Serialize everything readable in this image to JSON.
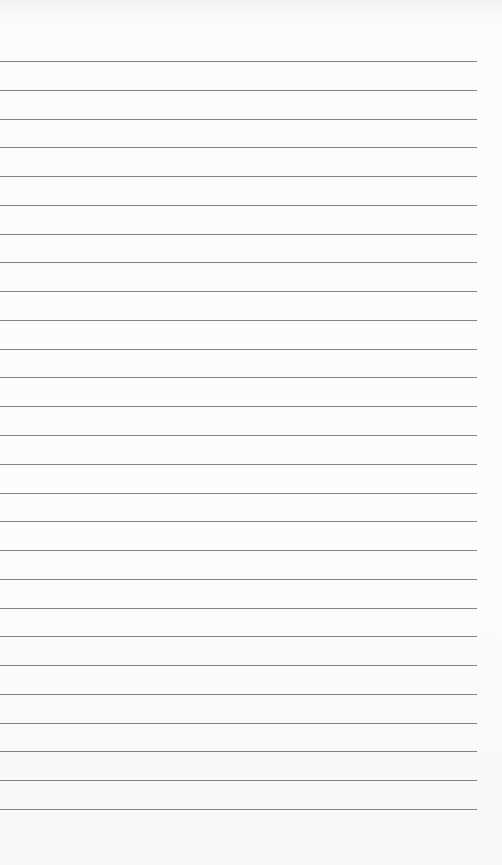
{
  "page": {
    "type": "lined-paper",
    "background_color": "#fcfcfc",
    "line_color": "#6e6e6e",
    "line_count": 27,
    "first_line_y": 61,
    "line_spacing": 28.77,
    "line_width": 477
  }
}
